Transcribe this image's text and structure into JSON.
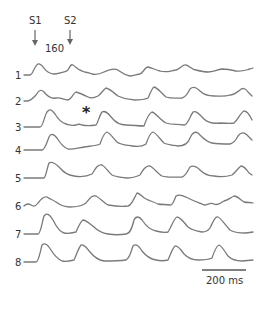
{
  "figure": {
    "stimuli": [
      {
        "label": "S1",
        "x": 35
      },
      {
        "label": "S2",
        "x": 70
      }
    ],
    "interval_label": "160",
    "asterisk": "*",
    "scale_bar": {
      "label": "200 ms"
    },
    "traces": [
      {
        "label": "1",
        "baseline": 75,
        "d": "M24,75 L30,75 C33,75 34,66 38,64 C42,63 44,70 48,72 C53,75 56,74 60,73 C64,72 66,72 68,70 C70,66 71,64 73,65 C76,67 78,70 82,71 C86,73 88,72 92,74 C96,75 100,74 104,72 C110,69 114,68 118,70 C122,73 124,75 130,76 C134,76 138,74 140,74 C143,73 145,67 148,67 C152,68 156,70 160,71 C166,73 170,71 176,70 C180,69 183,64 186,65 C190,66 192,70 196,70 C200,71 204,72 208,72 C213,72 216,70 222,69 C228,69 232,70 236,71 C242,72 246,70 250,69 L253,68"
      },
      {
        "label": "2",
        "baseline": 101,
        "d": "M24,101 L28,101 C32,100 33,98 36,95 C39,90 41,89 44,92 C48,97 52,99 56,98 C60,97 64,100 68,100 C72,99 73,93 76,92 C80,93 84,95 88,97 C92,99 96,97 98,96 C101,94 103,90 106,88 C110,89 114,93 118,96 C124,99 128,99 134,100 C140,100 144,100 148,98 C150,94 152,88 154,87 C158,88 162,94 166,97 C172,99 176,98 182,98 C186,97 188,93 190,89 C193,86 196,87 200,91 C204,95 208,96 214,96 C220,96 224,97 230,95 C234,95 236,93 240,90 C243,87 246,89 248,92 L252,96"
      },
      {
        "label": "3",
        "baseline": 127,
        "d": "M24,127 L40,127 C43,127 44,117 47,112 C50,108 52,110 55,114 C58,119 62,123 66,124 C70,125 72,126 76,125 C78,124 80,124 82,125 C86,126 90,126 96,125 C98,123 99,116 102,112 C105,110 108,113 112,118 C116,123 120,125 126,125 C132,125 138,126 144,126 C146,120 148,114 152,112 C156,113 160,120 166,123 C172,125 176,124 184,125 C188,125 190,116 193,112 C196,110 200,115 204,119 C208,123 212,124 220,123 C226,123 230,124 234,123 C238,120 240,113 244,111 C248,111 250,116 252,120"
      },
      {
        "label": "4",
        "baseline": 150,
        "d": "M24,150 L42,150 C45,150 47,142 49,137 C51,133 54,134 57,138 C60,143 63,147 68,149 C72,150 78,148 84,147 C90,146 96,146 100,144 C102,138 104,133 107,132 C110,133 113,138 117,142 C121,145 126,145 132,146 C138,147 142,147 146,144 C148,138 150,133 153,132 C156,133 160,139 164,143 C168,145 172,145 178,146 C184,146 188,144 190,138 C192,133 195,131 198,133 C202,137 206,142 212,143 C218,144 224,144 230,144 C234,143 236,140 238,136 C241,132 244,132 247,135 L252,140"
      },
      {
        "label": "5",
        "baseline": 178,
        "d": "M24,178 L44,178 C46,177 47,168 49,163 C52,161 56,164 60,168 C64,173 68,175 74,176 C80,177 86,177 92,174 C96,168 98,164 102,165 C106,167 108,172 112,175 C116,177 120,177 126,178 C132,178 136,177 140,175 C143,170 146,165 150,166 C154,168 158,174 162,176 C168,178 174,177 182,177 C186,176 188,170 190,167 C193,165 196,166 200,170 C204,174 208,176 214,176 C220,177 226,177 232,175 C236,172 238,168 241,166 C244,166 247,170 249,173 L252,175"
      },
      {
        "label": "6",
        "baseline": 206,
        "d": "M24,206 C26,204 28,203 31,205 C34,207 36,206 38,203 C41,199 44,196 47,197 C50,199 53,200 56,202 C60,205 64,207 70,207 C76,207 82,206 86,203 C90,198 92,195 96,196 C100,198 104,203 108,205 C114,206 120,207 128,206 C132,205 134,198 137,193 C140,193 142,197 146,199 C150,201 154,202 158,204 C162,205 166,204 170,205 C172,206 174,201 176,196 C180,194 184,196 190,199 C196,202 200,203 204,205 C208,205 210,202 214,204 C218,206 220,203 224,201 C228,200 230,198 234,196 C238,196 240,200 244,202 C248,203 250,202 253,203"
      },
      {
        "label": "7",
        "baseline": 234,
        "d": "M24,234 L38,234 C41,233 42,222 44,216 C47,212 50,215 53,220 C56,226 60,232 64,233 C68,234 72,233 76,232 C78,228 80,222 83,220 C86,220 90,224 94,227 C98,231 102,233 108,234 C114,235 120,235 126,234 C130,234 132,228 134,220 C136,216 139,216 142,220 C146,226 150,230 156,231 C160,232 164,233 168,232 C172,226 174,218 177,217 C180,217 184,222 188,227 C192,230 196,231 202,232 C206,232 208,231 210,228 C213,222 215,216 218,217 C221,218 225,225 230,230 C234,233 240,233 246,233 L253,232"
      },
      {
        "label": "8",
        "baseline": 262,
        "d": "M24,262 L36,262 C39,261 40,252 42,245 C45,242 48,245 51,250 C54,255 58,259 62,261 C66,262 70,261 74,260 C76,256 78,249 81,245 C84,244 87,248 90,252 C94,257 98,260 104,261 C110,261 118,261 126,260 C130,258 131,251 133,246 C136,243 139,246 142,251 C146,256 150,259 156,260 C160,261 164,261 168,260 C170,256 172,249 175,246 C178,245 181,250 184,254 C188,258 192,260 198,260 C204,260 208,260 212,258 C214,252 216,246 219,245 C222,246 225,252 228,256 C232,260 236,261 242,261 L253,260"
      }
    ]
  }
}
